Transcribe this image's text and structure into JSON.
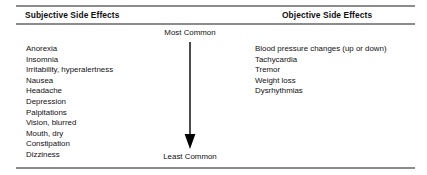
{
  "figure": {
    "columns": [
      {
        "header": "Subjective Side Effects",
        "items": [
          "Anorexia",
          "Insomnia",
          "Irritability, hyperalertness",
          "Nausea",
          "Headache",
          "Depression",
          "Palpitations",
          "Vision, blurred",
          "Mouth, dry",
          "Constipation",
          "Dizziness"
        ]
      },
      {
        "header": "Objective Side Effects",
        "items": [
          "Blood pressure changes (up or down)",
          "Tachycardia",
          "Tremor",
          "Weight loss",
          "Dysrhythmias"
        ]
      }
    ],
    "frequency_scale": {
      "top_label": "Most Common",
      "bottom_label": "Least Common",
      "arrow_direction": "down",
      "arrow_color": "#000000"
    },
    "rule_color": "#8c8c8c",
    "background_color": "#ffffff",
    "text_color": "#111111"
  }
}
